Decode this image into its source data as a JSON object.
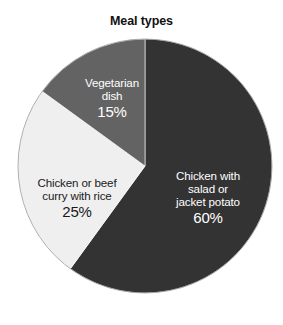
{
  "chart_data": {
    "type": "pie",
    "title": "Meal types",
    "subtitle": "",
    "xlabel": "",
    "ylabel": "",
    "legend_position": "none",
    "grid": false,
    "labels_inside_slices": true,
    "start_angle_deg": 0,
    "direction": "clockwise",
    "categories": [
      "Chicken with salad or jacket potato",
      "Chicken or beef curry with rice",
      "Vegetarian dish"
    ],
    "values": [
      60,
      25,
      15
    ],
    "value_labels": [
      "60%",
      "25%",
      "15%"
    ],
    "colors": [
      "#333333",
      "#efefef",
      "#636363"
    ],
    "label_colors": [
      "#ffffff",
      "#1a1a1a",
      "#ffffff"
    ],
    "slices": [
      {
        "name": "Chicken with salad or jacket potato",
        "label_lines": [
          "Chicken with",
          "salad or",
          "jacket potato"
        ],
        "percent": 60,
        "percent_label": "60%",
        "color": "#333333",
        "text_color": "#ffffff"
      },
      {
        "name": "Chicken or beef curry with rice",
        "label_lines": [
          "Chicken or beef",
          "curry with rice"
        ],
        "percent": 25,
        "percent_label": "25%",
        "color": "#efefef",
        "text_color": "#1a1a1a"
      },
      {
        "name": "Vegetarian dish",
        "label_lines": [
          "Vegetarian",
          "dish"
        ],
        "percent": 15,
        "percent_label": "15%",
        "color": "#636363",
        "text_color": "#ffffff"
      }
    ]
  },
  "figure": {
    "background": "#ffffff",
    "center_x": 145,
    "center_y": 166,
    "radius": 127
  }
}
